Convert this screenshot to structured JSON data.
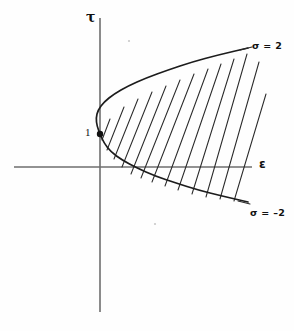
{
  "figure": {
    "background_color": "#fefefe",
    "ink_color": "#1c1c1c",
    "axis_color": "#6e6e6e"
  },
  "axes": {
    "vertical": {
      "label": "τ",
      "name": "tau",
      "x": 100,
      "y_top": 18,
      "y_bottom": 312
    },
    "horizontal": {
      "label": "ε",
      "name": "epsilon",
      "y": 167,
      "x_left": 14,
      "x_right": 252
    }
  },
  "annotations": {
    "vertex_value": "1",
    "sigma_upper": "σ = 2",
    "sigma_lower": "σ = –2"
  },
  "chart_data": {
    "type": "line",
    "title": "",
    "xlabel": "ε",
    "ylabel": "τ",
    "grid": false,
    "legend": null,
    "axis_origin_px": [
      100,
      167
    ],
    "marked_points": [
      {
        "label": "1",
        "px": [
          100,
          134
        ],
        "note": "vertex of parabola, filled dot on tau-axis"
      }
    ],
    "series": [
      {
        "name": "sigma = 2",
        "role": "upper boundary of shaded region",
        "label": "σ = 2",
        "label_px": [
          252,
          41
        ],
        "points_px": [
          [
            100,
            134
          ],
          [
            97,
            126
          ],
          [
            96,
            118
          ],
          [
            98,
            110
          ],
          [
            104,
            102
          ],
          [
            114,
            94
          ],
          [
            128,
            86
          ],
          [
            146,
            78
          ],
          [
            168,
            70
          ],
          [
            192,
            62
          ],
          [
            218,
            55
          ],
          [
            248,
            48
          ]
        ]
      },
      {
        "name": "sigma = -2",
        "role": "lower boundary of shaded region",
        "label": "σ = –2",
        "label_px": [
          250,
          208
        ],
        "points_px": [
          [
            100,
            134
          ],
          [
            104,
            143
          ],
          [
            111,
            152
          ],
          [
            122,
            160
          ],
          [
            137,
            168
          ],
          [
            155,
            176
          ],
          [
            176,
            183
          ],
          [
            198,
            190
          ],
          [
            222,
            196
          ],
          [
            248,
            202
          ]
        ]
      }
    ],
    "shaded_region": {
      "style": "diagonal hatching",
      "hatch_count": 13,
      "hatch_slope_dx": -13,
      "description": "region between the sigma = 2 and sigma = -2 curves, open to the right"
    }
  }
}
